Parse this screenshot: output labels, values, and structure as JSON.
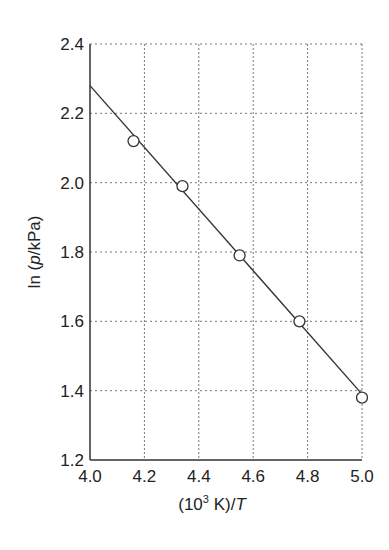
{
  "chart_data": {
    "type": "scatter",
    "title": "",
    "xlabel": "(10^3 K)/T",
    "ylabel": "ln (p/kPa)",
    "xlabel_parts": {
      "pre": "(10",
      "sup": "3",
      "mid": " K)/",
      "italic": "T"
    },
    "ylabel_parts": {
      "pre": "ln (",
      "italic": "p",
      "post": "/kPa)"
    },
    "xlim": [
      4.0,
      5.0
    ],
    "ylim": [
      1.2,
      2.4
    ],
    "xticks": [
      "4.0",
      "4.2",
      "4.4",
      "4.6",
      "4.8",
      "5.0"
    ],
    "yticks": [
      "1.2",
      "1.4",
      "1.6",
      "1.8",
      "2.0",
      "2.2",
      "2.4"
    ],
    "grid": true,
    "legend": null,
    "series": [
      {
        "name": "data",
        "marker": "open-circle",
        "x": [
          4.16,
          4.34,
          4.55,
          4.77,
          5.0
        ],
        "y": [
          2.12,
          1.99,
          1.79,
          1.6,
          1.38
        ]
      },
      {
        "name": "fit",
        "style": "line",
        "x": [
          4.0,
          5.0
        ],
        "y": [
          2.28,
          1.39
        ]
      }
    ]
  }
}
